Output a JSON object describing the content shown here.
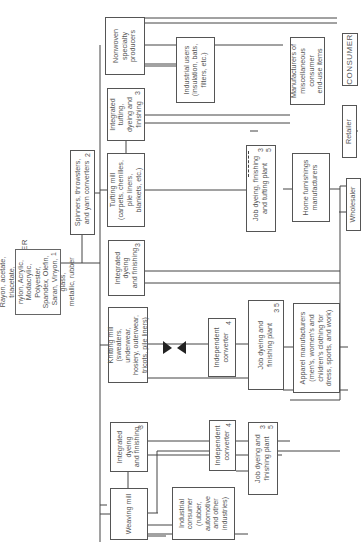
{
  "title": "FIBER PRODUCER",
  "boxes": {
    "fiber_producer": {
      "label": "Rayon, acetate, triacetate,\nnylon, Acrylic, Modacrylic,\nPolyester, Spandex, Olefin,\nSaran, Vinyon, glass,\nmetallic, rubber",
      "num": "1"
    },
    "spinners": {
      "label": "Spinners, throwsters,\nand yarn converters",
      "num": "2"
    },
    "nonwoven": {
      "label": "Nonwoven\nspecialty\nproducers"
    },
    "industrial_users": {
      "label": "Industrial users\n(insulation, bats,\nfilters, etc.)"
    },
    "misc_manufacturers": {
      "label": "Manufacturers of\nmiscellaneous\nconsumer\nend-use items"
    },
    "consumer": {
      "label": "CONSUMER"
    },
    "retailer": {
      "label": "Retailer"
    },
    "wholesaler": {
      "label": "Wholesaler"
    },
    "integrated_tufting": {
      "label": "Integrated\ntufting,\ndyeing and\nfinishing",
      "num": "3"
    },
    "tufting_mill": {
      "label": "Tufting mill\n(carpets, chenilles,\npile liners,\nblankets, etc.)"
    },
    "job_dyeing_tufting": {
      "label": "Job dyeing, finishing\nand tufting plant",
      "num": "3",
      "num2": "5"
    },
    "home_furnishings": {
      "label": "Home furnishings\nmanufacturers"
    },
    "integrated_dyeing_knit": {
      "label": "Integrated\ndyeing\nand finishing",
      "num": "3"
    },
    "knitting_mill": {
      "label": "Knitting mill\n(sweaters, underwear,\nhosiery, outerwear,\ntricots, pile liners)"
    },
    "independent_converter_knit": {
      "label": "Independent\nconverter",
      "num": "4"
    },
    "job_dyeing_knit": {
      "label": "Job dyeing and\nfinishing plant",
      "num": "3 5"
    },
    "apparel": {
      "label": "Apparel manufacturers\n(men's, women's and\nchildren's clothing for\ndress, sports, and work)"
    },
    "integrated_dyeing_weave": {
      "label": "Integrated\ndyeing\nand finishing",
      "num": "3"
    },
    "weaving_mill": {
      "label": "Weaving mill"
    },
    "independent_converter_weave": {
      "label": "Independent\nconverter",
      "num": "4"
    },
    "job_dyeing_weave": {
      "label": "Job dyeing and\nfinishing plant",
      "num": "3",
      "num2": "5"
    },
    "industrial_consumer": {
      "label": "Industrial\nconsumer\n(rubber,\nautomotive\nand other\nindustries)"
    }
  },
  "colors": {
    "line": "#444444",
    "text": "#555555",
    "background": "#ffffff"
  }
}
